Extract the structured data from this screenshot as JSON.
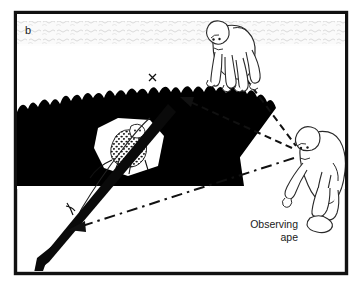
{
  "figure": {
    "panel_label": "b",
    "frame_color": "#111111",
    "background_color": "#ffffff",
    "foliage_color": "#000000",
    "sky_color": "#f2f2f2",
    "line_color": "#111111"
  },
  "labels": {
    "observing_ape_line1": "Observing",
    "observing_ape_line2": "ape",
    "trajectory_mark": "x"
  },
  "elements": {
    "panel_label_name": "panel-label-b",
    "sky_band_name": "sky-cloud-band",
    "foliage_name": "tree-canopy-silhouette",
    "leopard_name": "leopard-in-foliage",
    "signaler_ape_name": "signaling-ape",
    "observer_ape_name": "observing-ape",
    "throw_arrow_name": "thrown-object-trajectory-arrow",
    "gaze_line_1_name": "gaze-line-observer-to-signaler",
    "gaze_line_2_name": "gaze-line-observer-to-target",
    "gaze_line_3_name": "gaze-line-signaler-to-target"
  }
}
